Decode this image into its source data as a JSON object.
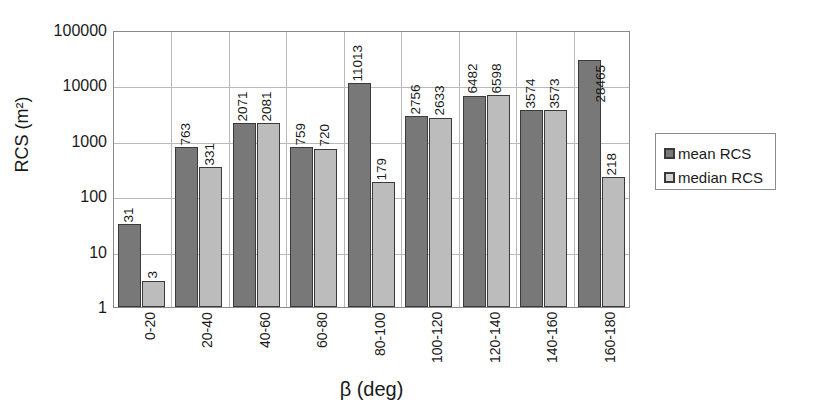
{
  "chart_data": {
    "type": "bar",
    "title": "",
    "xlabel": "β (deg)",
    "ylabel": "RCS (m²)",
    "yscale": "log",
    "ylim": [
      1,
      100000
    ],
    "ytick_labels": [
      "100000",
      "10000",
      "1000",
      "100",
      "10",
      "1"
    ],
    "ytick_values": [
      100000,
      10000,
      1000,
      100,
      10,
      1
    ],
    "grid": true,
    "legend_position": "right-outside",
    "categories": [
      "0-20",
      "20-40",
      "40-60",
      "60-80",
      "80-100",
      "100-120",
      "120-140",
      "140-160",
      "160-180"
    ],
    "series": [
      {
        "name": "mean RCS",
        "color": "#787878",
        "values": [
          31,
          763,
          2071,
          759,
          11013,
          2756,
          6482,
          3574,
          28465
        ],
        "labels": [
          "31",
          "763",
          "2071",
          "759",
          "11013",
          "2756",
          "6482",
          "3574",
          "28465"
        ]
      },
      {
        "name": "median RCS",
        "color": "#bcbcbc",
        "values": [
          3,
          331,
          2081,
          720,
          179,
          2633,
          6598,
          3573,
          218
        ],
        "labels": [
          "3",
          "331",
          "2081",
          "720",
          "179",
          "2633",
          "6598",
          "3573",
          "218"
        ]
      }
    ]
  },
  "legend": {
    "entries": [
      {
        "label": "mean RCS",
        "swatch": "mean"
      },
      {
        "label": "median RCS",
        "swatch": "median"
      }
    ]
  }
}
